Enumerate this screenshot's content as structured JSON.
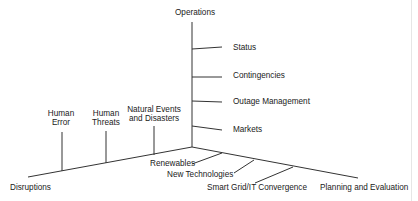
{
  "diagram": {
    "type": "three-axis fishbone diagram",
    "axes": {
      "vertical": {
        "label": "Operations",
        "branches": [
          "Status",
          "Contingencies",
          "Outage Management",
          "Markets"
        ]
      },
      "left": {
        "label": "Disruptions",
        "branches": [
          {
            "lines": [
              "Human",
              "Error"
            ]
          },
          {
            "lines": [
              "Human",
              "Threats"
            ]
          },
          {
            "lines": [
              "Natural Events",
              "and Disasters"
            ]
          }
        ]
      },
      "right": {
        "label": "Planning and Evaluation",
        "branches": [
          "Renewables",
          "New Technologies",
          "Smart Grid/IT Convergence"
        ]
      }
    },
    "colors": {
      "line": "#333333",
      "text": "#1a1a1a",
      "background": "#ffffff"
    }
  }
}
